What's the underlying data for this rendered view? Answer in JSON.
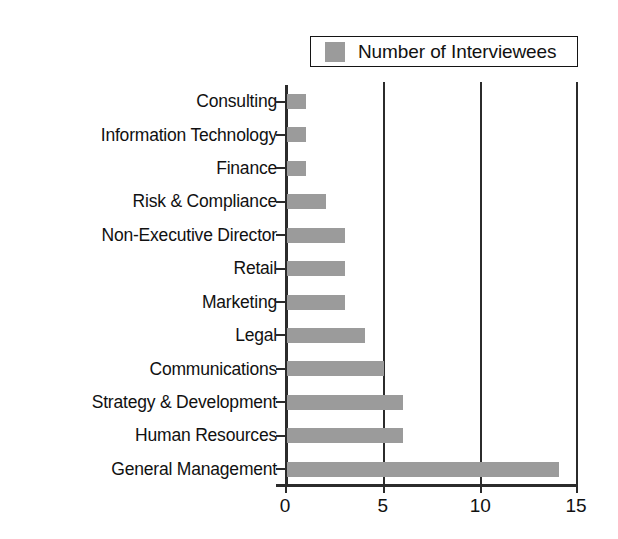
{
  "chart_data": {
    "type": "bar",
    "orientation": "horizontal",
    "title": "",
    "xlabel": "",
    "ylabel": "",
    "xlim": [
      0,
      15
    ],
    "xticks": [
      "0",
      "5",
      "10",
      "15"
    ],
    "grid": "vertical gridlines at 5, 10, 15",
    "legend": {
      "position": "top-right",
      "entries": [
        {
          "name": "Number of Interviewees",
          "color": "#9b9b9b"
        }
      ]
    },
    "series": [
      {
        "name": "Number of Interviewees",
        "color": "#9b9b9b",
        "values": [
          1,
          1,
          1,
          2,
          3,
          3,
          3,
          4,
          5,
          6,
          6,
          14
        ]
      }
    ],
    "categories": [
      "Consulting",
      "Information Technology",
      "Finance",
      "Risk & Compliance",
      "Non-Executive Director",
      "Retail",
      "Marketing",
      "Legal",
      "Communications",
      "Strategy & Development",
      "Human Resources",
      "General Management"
    ],
    "points": [
      {
        "category": "Consulting",
        "value": 1
      },
      {
        "category": "Information Technology",
        "value": 1
      },
      {
        "category": "Finance",
        "value": 1
      },
      {
        "category": "Risk & Compliance",
        "value": 2
      },
      {
        "category": "Non-Executive Director",
        "value": 3
      },
      {
        "category": "Retail",
        "value": 3
      },
      {
        "category": "Marketing",
        "value": 3
      },
      {
        "category": "Legal",
        "value": 4
      },
      {
        "category": "Communications",
        "value": 5
      },
      {
        "category": "Strategy & Development",
        "value": 6
      },
      {
        "category": "Human Resources",
        "value": 6
      },
      {
        "category": "General Management",
        "value": 14
      }
    ]
  },
  "colors": {
    "bar": "#9b9b9b",
    "axis": "#2b2b2b",
    "text": "#111111",
    "background": "#ffffff"
  }
}
